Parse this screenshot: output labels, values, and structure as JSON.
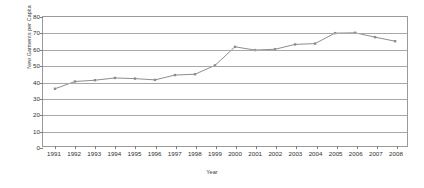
{
  "chart_data": {
    "type": "line",
    "title": "",
    "xlabel": "Year",
    "ylabel": "New Garments per Capita",
    "categories": [
      "1991",
      "1992",
      "1993",
      "1994",
      "1995",
      "1996",
      "1997",
      "1998",
      "1999",
      "2000",
      "2001",
      "2002",
      "2003",
      "2004",
      "2005",
      "2006",
      "2007",
      "2008"
    ],
    "values": [
      35.5,
      40.0,
      40.8,
      42.2,
      41.8,
      41.0,
      44.0,
      44.5,
      50.0,
      61.5,
      59.5,
      60.0,
      63.0,
      63.5,
      70.0,
      70.2,
      67.5,
      65.0
    ],
    "series": [
      {
        "name": "New Garments per Capita",
        "values": [
          35.5,
          40.0,
          40.8,
          42.2,
          41.8,
          41.0,
          44.0,
          44.5,
          50.0,
          61.5,
          59.5,
          60.0,
          63.0,
          63.5,
          70.0,
          70.2,
          67.5,
          65.0
        ]
      }
    ],
    "ylim": [
      0,
      80
    ],
    "yticks": [
      0,
      10,
      20,
      30,
      40,
      50,
      60,
      70,
      80
    ],
    "ytick_labels": [
      "0",
      "10",
      "20",
      "30",
      "40",
      "50",
      "60",
      "70",
      "80"
    ],
    "xtick_labels": [
      "1991",
      "1992",
      "1993",
      "1994",
      "1995",
      "1996",
      "1997",
      "1998",
      "1999",
      "2000",
      "2001",
      "2002",
      "2003",
      "2004",
      "2005",
      "2006",
      "2007",
      "2008"
    ],
    "grid": "horizontal",
    "legend": "none",
    "line_color": "#8c8c8c",
    "marker": "square",
    "marker_color": "#8c8c8c",
    "grid_color": "#a8a8a8",
    "border_color": "#9a9a9a",
    "background": "#ffffff"
  }
}
